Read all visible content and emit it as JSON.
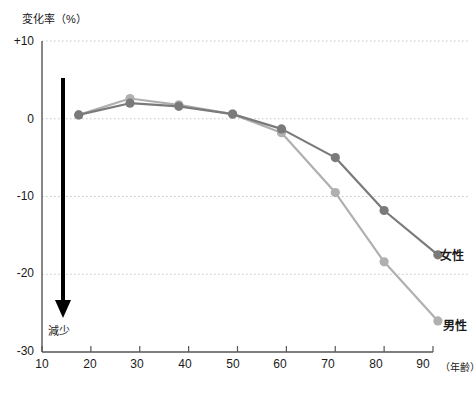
{
  "chart_data": {
    "type": "line",
    "title": "",
    "ylabel": "変化率（%）",
    "xlabel": "（年齢）",
    "xlim": [
      10,
      95
    ],
    "ylim": [
      -30,
      10
    ],
    "yticks": [
      10,
      0,
      -10,
      -20,
      -30
    ],
    "ytick_labels": [
      "+10",
      "0",
      "-10",
      "-20",
      "-30"
    ],
    "xticks": [
      10,
      20,
      30,
      40,
      50,
      60,
      70,
      80,
      90
    ],
    "xtick_labels": [
      "10",
      "20",
      "30",
      "40",
      "50",
      "60",
      "70",
      "80",
      "90"
    ],
    "grid": true,
    "grid_style": "dotted-horizontal",
    "legend_position": "right-inline",
    "series": [
      {
        "name": "女性",
        "color": "#7a7a7a",
        "x": [
          17.5,
          28,
          38,
          49,
          59,
          70,
          80,
          91
        ],
        "values": [
          0.5,
          2.0,
          1.6,
          0.6,
          -1.3,
          -5.0,
          -11.8,
          -17.5
        ]
      },
      {
        "name": "男性",
        "color": "#b0b0b0",
        "x": [
          17.5,
          28,
          38,
          49,
          59,
          70,
          80,
          91
        ],
        "values": [
          0.5,
          2.6,
          1.8,
          0.6,
          -1.8,
          -9.5,
          -18.4,
          -26.0
        ]
      }
    ],
    "annotations": [
      {
        "text": "減少",
        "type": "arrow-down-label"
      }
    ]
  },
  "axis": {
    "y_title": "変化率（%）",
    "x_unit": "（年齢）"
  },
  "colors": {
    "female": "#7a7a7a",
    "male": "#b0b0b0",
    "axis": "#555555",
    "grid": "#c8c8c8",
    "arrow": "#000000"
  }
}
